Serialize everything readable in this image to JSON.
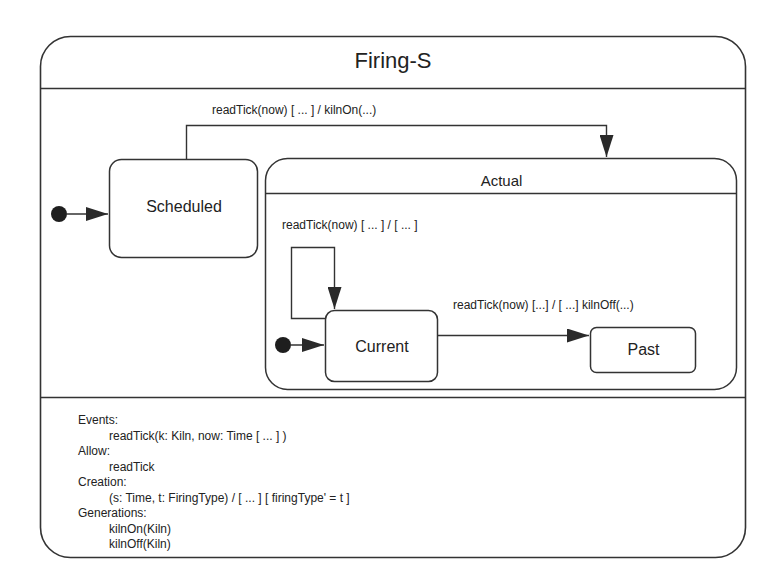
{
  "diagram": {
    "title": "Firing-S",
    "states": {
      "scheduled": "Scheduled",
      "actual": "Actual",
      "current": "Current",
      "past": "Past"
    },
    "transitions": {
      "scheduled_to_actual": "readTick(now) [ ... ] / kilnOn(...)",
      "current_self_loop": "readTick(now) [ ... ] /  [ ... ]",
      "current_to_past": "readTick(now) [...] / [ ...]  kilnOff(...)"
    },
    "info": {
      "events_label": "Events:",
      "events": [
        "readTick(k: Kiln, now: Time [ ... ] )"
      ],
      "allow_label": "Allow:",
      "allow": [
        "readTick"
      ],
      "creation_label": "Creation:",
      "creation": [
        "(s: Time, t: FiringType) / [ ... ] [ firingType' = t ]"
      ],
      "generations_label": "Generations:",
      "generations": [
        "kilnOn(Kiln)",
        "kilnOff(Kiln)"
      ]
    },
    "colors": {
      "line": "#333333",
      "background": "#ffffff"
    }
  }
}
